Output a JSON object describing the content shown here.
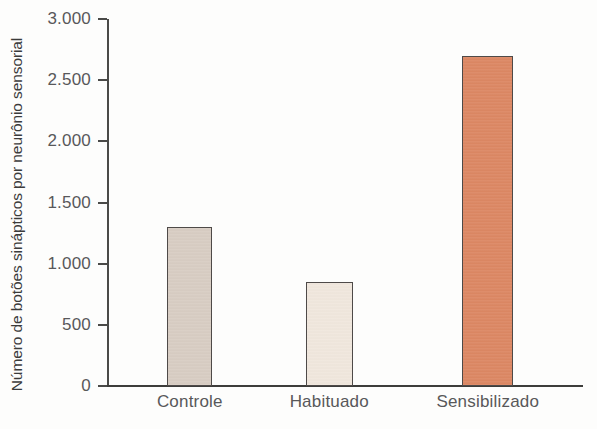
{
  "chart_data": {
    "type": "bar",
    "title": "",
    "subtitle": "",
    "xlabel": "",
    "ylabel": "Número de botões sinápticos por neurônio sensorial",
    "categories": [
      "Controle",
      "Habituado",
      "Sensibilizado"
    ],
    "values": [
      1300,
      850,
      2700
    ],
    "series": [
      {
        "name": "Número de botões sinápticos por neurônio sensorial",
        "values": [
          1300,
          850,
          2700
        ]
      }
    ],
    "ylim": [
      0,
      3000
    ],
    "xlim": [
      0,
      3
    ],
    "y_ticks": [
      0,
      500,
      1000,
      1500,
      2000,
      2500,
      3000
    ],
    "y_tick_labels": [
      "0",
      "500",
      "1.000",
      "1.500",
      "2.000",
      "2.500",
      "3.000"
    ],
    "grid": false,
    "legend": false,
    "legend_position": "none",
    "bar_colors": [
      "#d8cdc3",
      "#f0e7dd",
      "#dc8763"
    ],
    "bar_edge_color": "#4e4a48",
    "axis_color": "#46443f",
    "tick_label_color": "#58585a",
    "background_color": "#fdfdfc",
    "bars": [
      {
        "category": "Controle",
        "value": 1300,
        "color": "#d8cdc3",
        "center_pct": 17.4,
        "width_pct": 9.5
      },
      {
        "category": "Habituado",
        "value": 850,
        "color": "#f0e7dd",
        "center_pct": 46.7,
        "width_pct": 9.9
      },
      {
        "category": "Sensibilizado",
        "value": 2700,
        "color": "#dc8763",
        "center_pct": 80.0,
        "width_pct": 10.7
      }
    ]
  }
}
